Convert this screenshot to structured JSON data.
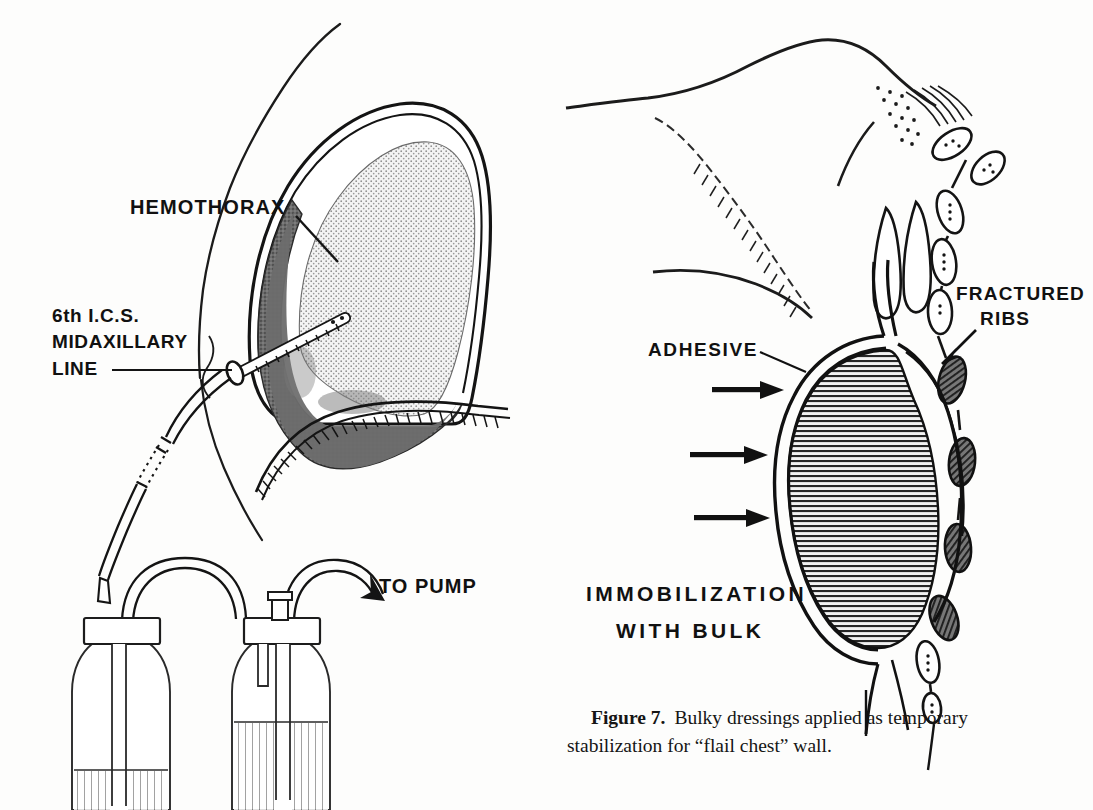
{
  "page": {
    "background_color": "#fdfdfc",
    "ink_color": "#111111",
    "width": 1093,
    "height": 810
  },
  "left_figure": {
    "name": "closed-chest-drainage-for-hemothorax",
    "labels": {
      "hemothorax": "HEMOTHORAX",
      "ics_line1": "6th I.C.S.",
      "ics_line2": "MIDAXILLARY",
      "ics_line3": "LINE",
      "to_pump": "TO PUMP"
    },
    "shading": {
      "hemothorax_fill": "#6e6e6e",
      "lung_fill": "#f1f1f1",
      "lung_stipple": "#9a9a9a"
    },
    "parts": [
      "chest-wall-outline",
      "lung",
      "hemothorax-collection",
      "diaphragm",
      "chest-tube",
      "tube-connector",
      "drainage-bottle-left",
      "drainage-bottle-right",
      "suction-tubing"
    ]
  },
  "right_figure": {
    "name": "bulky-dressing-immobilization-flail-chest",
    "labels": {
      "adhesive": "ADHESIVE",
      "fractured_line1": "FRACTURED",
      "fractured_line2": "RIBS",
      "immobilization_line1": "IMMOBILIZATION",
      "immobilization_line2": "WITH BULK"
    },
    "arrows": {
      "count": 3,
      "direction": "right",
      "meaning": "compression-force"
    },
    "shading": {
      "bulk_dressing_fill": "#efefef",
      "bulk_dressing_hatch": "#2a2a2a",
      "fractured_rib_fill": "#707070"
    },
    "parts": [
      "neck-and-shoulder-outline",
      "rib-cross-sections",
      "fractured-ribs",
      "bulk-dressing-pad",
      "adhesive-strapping",
      "compression-arrows"
    ]
  },
  "caption": {
    "figure_number": "Figure 7.",
    "text": "Bulky dressings applied as temporary stabilization for “flail chest” wall."
  }
}
